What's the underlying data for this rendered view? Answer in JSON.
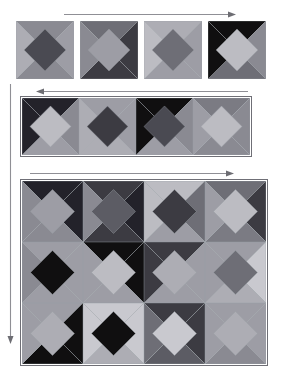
{
  "figure": {
    "background_color": "#ffffff",
    "canvas": {
      "width": 286,
      "height": 361
    },
    "tile_model": {
      "description": "Each tile is a square divided into four corner triangles (top, right, bottom, left) plus a rotated center diamond.",
      "regions": [
        "top",
        "right",
        "bottom",
        "left",
        "center"
      ],
      "seam_color": "#9aa0a6",
      "seam_width": 0.7
    },
    "palette": {
      "near-black": "#100f10",
      "very-dark": "#23222a",
      "dark": "#3c3b42",
      "dark-slate": "#4a4a52",
      "mid-dark": "#5c5c64",
      "mid": "#6e6e76",
      "mid-gray": "#7b7b83",
      "gray": "#8a8a92",
      "light-gray": "#9d9da5",
      "light": "#adadb4",
      "lighter": "#bcbcc2",
      "pale": "#c9c9cf",
      "very-pale": "#d6d6da"
    },
    "arrows": {
      "color": "#8f8f95",
      "head_color": "#6d6d73",
      "top_arrow": {
        "direction": "right",
        "label": "row-1-progression"
      },
      "middle_arrow": {
        "direction": "left",
        "label": "row-2-progression"
      },
      "bottom_arrow": {
        "direction": "right",
        "label": "row-3-progression"
      },
      "left_arrow": {
        "direction": "down",
        "label": "scale-progression"
      }
    }
  },
  "panels": [
    {
      "name": "row-1",
      "kind": "separated-tiles",
      "tile_count": 4,
      "tiles": [
        {
          "id": "r1c1",
          "top": "gray",
          "right": "light-gray",
          "bottom": "gray",
          "left": "light",
          "center": "dark-slate"
        },
        {
          "id": "r1c2",
          "top": "mid",
          "right": "dark",
          "bottom": "dark",
          "left": "gray",
          "center": "light-gray"
        },
        {
          "id": "r1c3",
          "top": "light",
          "right": "light-gray",
          "bottom": "light-gray",
          "left": "lighter",
          "center": "mid"
        },
        {
          "id": "r1c4",
          "top": "near-black",
          "right": "gray",
          "bottom": "mid",
          "left": "near-black",
          "center": "lighter"
        }
      ]
    },
    {
      "name": "row-2",
      "kind": "contiguous-strip",
      "tile_count": 4,
      "border_color": "#6f6f76",
      "tiles": [
        {
          "id": "r2c1",
          "top": "very-dark",
          "right": "gray",
          "bottom": "light-gray",
          "left": "very-dark",
          "center": "lighter"
        },
        {
          "id": "r2c2",
          "top": "light-gray",
          "right": "light-gray",
          "bottom": "light",
          "left": "light",
          "center": "dark"
        },
        {
          "id": "r2c3",
          "top": "near-black",
          "right": "gray",
          "bottom": "light-gray",
          "left": "near-black",
          "center": "dark-slate"
        },
        {
          "id": "r2c4",
          "top": "mid-gray",
          "right": "gray",
          "bottom": "gray",
          "left": "light-gray",
          "center": "lighter"
        }
      ]
    },
    {
      "name": "row-3",
      "kind": "contiguous-grid",
      "columns": 4,
      "rows": 3,
      "border_color": "#6f6f76",
      "tiles": [
        {
          "id": "g-r1c1",
          "top": "very-dark",
          "right": "very-dark",
          "bottom": "gray",
          "left": "gray",
          "center": "light-gray"
        },
        {
          "id": "g-r1c2",
          "top": "dark",
          "right": "very-dark",
          "bottom": "dark",
          "left": "gray",
          "center": "mid-dark"
        },
        {
          "id": "g-r1c3",
          "top": "lighter",
          "right": "mid",
          "bottom": "light-gray",
          "left": "lighter",
          "center": "dark"
        },
        {
          "id": "g-r1c4",
          "top": "mid",
          "right": "dark",
          "bottom": "mid-gray",
          "left": "light-gray",
          "center": "lighter"
        },
        {
          "id": "g-r2c1",
          "top": "light-gray",
          "right": "light-gray",
          "bottom": "light-gray",
          "left": "gray",
          "center": "near-black"
        },
        {
          "id": "g-r2c2",
          "top": "near-black",
          "right": "near-black",
          "bottom": "light-gray",
          "left": "light-gray",
          "center": "lighter"
        },
        {
          "id": "g-r2c3",
          "top": "dark",
          "right": "light-gray",
          "bottom": "light-gray",
          "left": "dark",
          "center": "light"
        },
        {
          "id": "g-r2c4",
          "top": "light-gray",
          "right": "pale",
          "bottom": "light",
          "left": "light-gray",
          "center": "mid"
        },
        {
          "id": "g-r3c1",
          "top": "light-gray",
          "right": "near-black",
          "bottom": "near-black",
          "left": "light-gray",
          "center": "light"
        },
        {
          "id": "g-r3c2",
          "top": "pale",
          "right": "pale",
          "bottom": "light",
          "left": "pale",
          "center": "near-black"
        },
        {
          "id": "g-r3c3",
          "top": "dark",
          "right": "dark",
          "bottom": "mid-dark",
          "left": "mid",
          "center": "pale"
        },
        {
          "id": "g-r3c4",
          "top": "light-gray",
          "right": "light-gray",
          "bottom": "gray",
          "left": "light-gray",
          "center": "light"
        }
      ]
    }
  ]
}
